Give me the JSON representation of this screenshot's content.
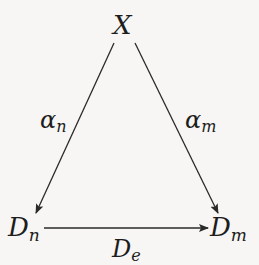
{
  "diagram": {
    "type": "commutative-diagram",
    "nodes": {
      "top": {
        "symbol": "X",
        "sub": ""
      },
      "left": {
        "symbol": "D",
        "sub": "n"
      },
      "right": {
        "symbol": "D",
        "sub": "m"
      }
    },
    "edges": {
      "left": {
        "from": "X",
        "to": "D_n",
        "symbol": "α",
        "sub": "n"
      },
      "right": {
        "from": "X",
        "to": "D_m",
        "symbol": "α",
        "sub": "m"
      },
      "bottom": {
        "from": "D_n",
        "to": "D_m",
        "symbol": "D",
        "sub": "e"
      }
    },
    "colors": {
      "line": "#2a2a2a",
      "text": "#1d1d1d",
      "background": "#f7f6f4"
    }
  }
}
